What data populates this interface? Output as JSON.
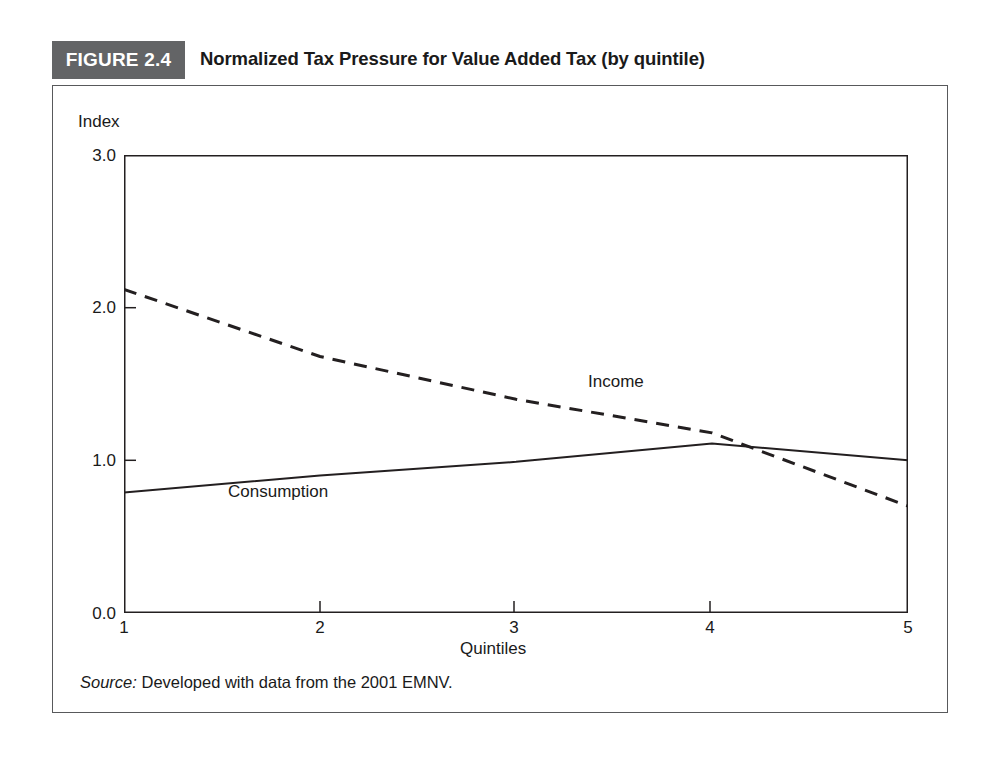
{
  "figure": {
    "badge_label": "FIGURE 2.4",
    "title": "Normalized Tax Pressure for Value Added Tax (by quintile)",
    "source_label": "Source:",
    "source_text": " Developed with data from the 2001 EMNV.",
    "badge_color": "#636466",
    "frame_color": "#58595b",
    "line_color": "#231f20"
  },
  "chart_data": {
    "type": "line",
    "title": "Normalized Tax Pressure for Value Added Tax (by quintile)",
    "xlabel": "Quintiles",
    "ylabel": "Index",
    "x": [
      1,
      2,
      3,
      4,
      5
    ],
    "categories": [
      "1",
      "2",
      "3",
      "4",
      "5"
    ],
    "xtick_labels": [
      "1",
      "2",
      "3",
      "4",
      "5"
    ],
    "ytick_labels": [
      "0.0",
      "1.0",
      "2.0",
      "3.0"
    ],
    "ytick_values": [
      0.0,
      1.0,
      2.0,
      3.0
    ],
    "ylim": [
      0.0,
      3.0
    ],
    "xlim": [
      1,
      5
    ],
    "grid": false,
    "legend": "inline-annotations",
    "series": [
      {
        "name": "Income",
        "style": "dashed",
        "color": "#231f20",
        "values": [
          2.12,
          1.68,
          1.4,
          1.18,
          0.7
        ]
      },
      {
        "name": "Consumption",
        "style": "solid",
        "color": "#231f20",
        "values": [
          0.79,
          0.9,
          0.99,
          1.11,
          1.0
        ]
      }
    ],
    "annotations": [
      {
        "text": "Income",
        "x": 3.4,
        "y": 1.58
      },
      {
        "text": "Consumption",
        "x": 1.55,
        "y": 0.87
      }
    ]
  }
}
